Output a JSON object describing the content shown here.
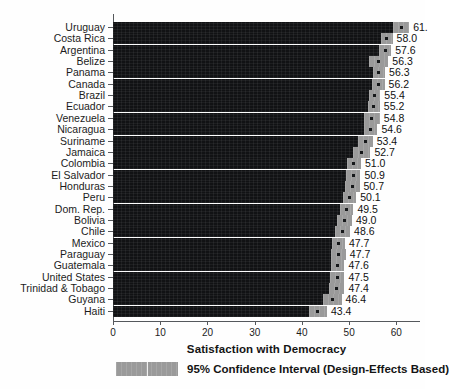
{
  "chart_data": {
    "type": "bar",
    "orientation": "horizontal",
    "title": "",
    "xlabel": "Satisfaction with Democracy",
    "ylabel": "",
    "xlim": [
      0,
      65
    ],
    "xticks": [
      0,
      10,
      20,
      30,
      40,
      50,
      60
    ],
    "grid": false,
    "legend_position": "bottom-left",
    "legend": [
      {
        "label": "95% Confidence Interval (Design-Effects Based)",
        "color": "#9a9a9a"
      }
    ],
    "series_name": "Satisfaction with Democracy",
    "bar_color": "#111214",
    "ci_color": "#9a9a9a",
    "point_color": "#16181a",
    "categories": [
      "Uruguay",
      "Costa Rica",
      "Argentina",
      "Belize",
      "Panama",
      "Canada",
      "Brazil",
      "Ecuador",
      "Venezuela",
      "Nicaragua",
      "Suriname",
      "Jamaica",
      "Colombia",
      "El Salvador",
      "Honduras",
      "Peru",
      "Dom. Rep.",
      "Bolivia",
      "Chile",
      "Mexico",
      "Paraguay",
      "Guatemala",
      "United States",
      "Trinidad & Tobago",
      "Guyana",
      "Haiti"
    ],
    "values": [
      61.0,
      58.0,
      57.6,
      56.3,
      56.3,
      56.2,
      55.4,
      55.2,
      54.8,
      54.6,
      53.4,
      52.7,
      51.0,
      50.9,
      50.7,
      50.1,
      49.5,
      49.0,
      48.6,
      47.7,
      47.7,
      47.6,
      47.5,
      47.4,
      46.4,
      43.4
    ],
    "value_labels": [
      "61.",
      "58.0",
      "57.6",
      "56.3",
      "56.3",
      "56.2",
      "55.4",
      "55.2",
      "54.8",
      "54.6",
      "53.4",
      "52.7",
      "51.0",
      "50.9",
      "50.7",
      "50.1",
      "49.5",
      "49.0",
      "48.6",
      "47.7",
      "47.7",
      "47.6",
      "47.5",
      "47.4",
      "46.4",
      "43.4"
    ],
    "ci_low": [
      59.3,
      56.8,
      56.3,
      54.3,
      55.0,
      54.9,
      54.2,
      53.9,
      53.1,
      53.2,
      51.8,
      50.9,
      49.5,
      49.4,
      49.2,
      48.7,
      48.1,
      47.4,
      47.0,
      46.3,
      46.1,
      46.2,
      46.0,
      45.8,
      44.4,
      41.5
    ],
    "ci_high": [
      62.7,
      59.2,
      58.9,
      58.3,
      57.6,
      57.5,
      56.6,
      56.5,
      56.5,
      56.0,
      55.0,
      54.5,
      52.5,
      52.4,
      52.2,
      51.5,
      50.9,
      50.6,
      50.2,
      49.1,
      49.3,
      49.0,
      49.0,
      49.0,
      48.4,
      45.3
    ]
  },
  "axis": {
    "xtick_labels": [
      "0",
      "10",
      "20",
      "30",
      "40",
      "50",
      "60"
    ]
  }
}
